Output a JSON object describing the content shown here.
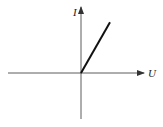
{
  "diagram": {
    "title": "",
    "type": "I-U characteristic",
    "axes": {
      "x_label": "U",
      "y_label": "I"
    },
    "curve": {
      "description": "straight line through origin, positive slope, first quadrant only",
      "start": {
        "U": 0,
        "I": 0
      },
      "end": {
        "U": 1,
        "I": 1.75
      }
    },
    "colors": {
      "axis": "#333333",
      "curve": "#111111"
    }
  }
}
